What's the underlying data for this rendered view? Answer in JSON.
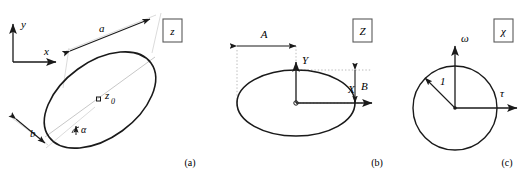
{
  "figure": {
    "stroke_color": "#1a1a1a",
    "guide_color": "#8d8d8d",
    "dotted_color": "#9a9a9a",
    "panels": [
      {
        "id": "panel-a",
        "caption": "(a)",
        "plane_box_label": "z",
        "shape": "tilted-ellipse",
        "labels": {
          "axis_y": "y",
          "axis_x": "x",
          "semi_major": "a",
          "semi_minor": "b",
          "tilt_angle": "α",
          "center": "z",
          "center_subscript": "0"
        },
        "geometry": {
          "center_x": 100,
          "center_y": 100,
          "semi_major": 63,
          "semi_minor": 38,
          "rotation_deg": -36,
          "axes_origin_x": 13,
          "axes_origin_y": 62
        }
      },
      {
        "id": "panel-b",
        "caption": "(b)",
        "plane_box_label": "Z",
        "shape": "axis-aligned-ellipse",
        "labels": {
          "axis_Y": "Y",
          "axis_X": "X",
          "dimension_A": "A",
          "dimension_B": "B"
        },
        "geometry": {
          "center_x": 296,
          "center_y": 103,
          "semi_major": 59,
          "semi_minor": 33
        }
      },
      {
        "id": "panel-c",
        "caption": "(c)",
        "plane_box_label": "χ",
        "shape": "unit-circle",
        "labels": {
          "axis_omega": "ω",
          "axis_tau": "τ",
          "radius": "1"
        },
        "geometry": {
          "center_x": 455,
          "center_y": 108,
          "radius": 42
        }
      }
    ]
  }
}
